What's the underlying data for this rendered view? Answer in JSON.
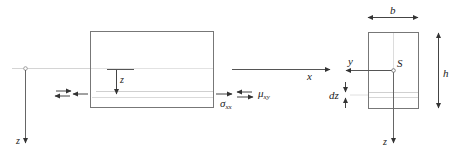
{
  "diagram": {
    "type": "beam-section-stress",
    "colors": {
      "stroke": "#555555",
      "axis_light": "#c8c8c8",
      "layer": "#d0d0d0",
      "text": "#222222",
      "background": "#ffffff"
    },
    "beam_side_view": {
      "axis_label_x": "x",
      "axis_label_z_left": "z",
      "local_z_label": "z",
      "stress_normal": {
        "symbol": "σ",
        "subscript": "xx"
      },
      "stress_shear": {
        "symbol": "μ",
        "subscript": "xy"
      }
    },
    "cross_section": {
      "width_label": "b",
      "height_label": "h",
      "centroid_label": "S",
      "axis_label_y": "y",
      "axis_label_z": "z",
      "layer_thickness_label": "dz"
    }
  }
}
